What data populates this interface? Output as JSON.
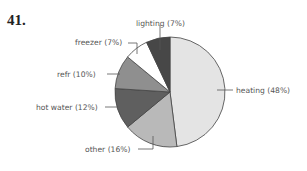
{
  "problem_number": "41.",
  "chart_data": {
    "type": "pie",
    "title": "",
    "start_angle": "12 o'clock, clockwise",
    "slices": [
      {
        "label": "heating",
        "value": 48,
        "text": "heating (48%)",
        "color": "#e4e4e4"
      },
      {
        "label": "other",
        "value": 16,
        "text": "other (16%)",
        "color": "#b9b9b9"
      },
      {
        "label": "hot water",
        "value": 12,
        "text": "hot water (12%)",
        "color": "#5f5f5f"
      },
      {
        "label": "refr",
        "value": 10,
        "text": "refr (10%)",
        "color": "#8f8f8f"
      },
      {
        "label": "freezer",
        "value": 7,
        "text": "freezer (7%)",
        "color": "#ffffff"
      },
      {
        "label": "lighting",
        "value": 7,
        "text": "lighting (7%)",
        "color": "#474747"
      }
    ]
  }
}
